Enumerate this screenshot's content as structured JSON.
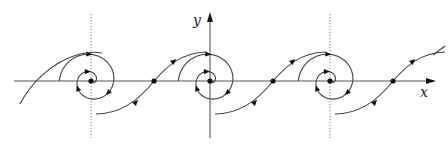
{
  "diagram": {
    "type": "phase-portrait",
    "axes": {
      "x_label": "x",
      "y_label": "y"
    },
    "spiral_centers": [
      {
        "x": 91,
        "y": 81
      },
      {
        "x": 210,
        "y": 81
      },
      {
        "x": 330,
        "y": 81
      }
    ],
    "saddle_points": [
      {
        "x": 154,
        "y": 81
      },
      {
        "x": 273,
        "y": 81
      },
      {
        "x": 393,
        "y": 81
      }
    ],
    "colors": {
      "curve": "#444444",
      "axis": "#555555",
      "point": "#111111"
    }
  }
}
